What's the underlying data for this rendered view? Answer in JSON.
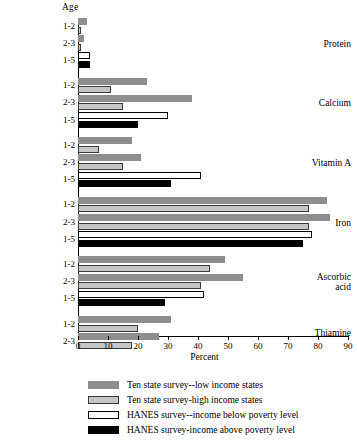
{
  "chart_data": {
    "type": "bar",
    "orientation": "horizontal",
    "title": "",
    "xlabel": "Percent",
    "ylabel": "Age",
    "xlim": [
      0,
      90
    ],
    "xticks": [
      0,
      10,
      20,
      30,
      40,
      50,
      60,
      70,
      80,
      90
    ],
    "grid": false,
    "legend_position": "bottom",
    "series": [
      {
        "name": "Ten state survey--low income states",
        "key": "s0",
        "color": "#8e8e8e"
      },
      {
        "name": "Ten state survey-high income states",
        "key": "s1",
        "color": "#c6c6c6"
      },
      {
        "name": "HANES survey--income below poverty level",
        "key": "s2",
        "color": "#ffffff"
      },
      {
        "name": "HANES survey-income above poverty level",
        "key": "s3",
        "color": "#000000"
      }
    ],
    "groups": [
      {
        "nutrient": "Protein",
        "rows": [
          {
            "age": "1-2",
            "bars": [
              {
                "series": 0,
                "value": 3
              },
              {
                "series": 1,
                "value": 1
              }
            ]
          },
          {
            "age": "2-3",
            "bars": [
              {
                "series": 0,
                "value": 2
              },
              {
                "series": 1,
                "value": 1
              }
            ]
          },
          {
            "age": "1-5",
            "bars": [
              {
                "series": 2,
                "value": 4
              },
              {
                "series": 3,
                "value": 4
              }
            ]
          }
        ]
      },
      {
        "nutrient": "Calcium",
        "rows": [
          {
            "age": "1-2",
            "bars": [
              {
                "series": 0,
                "value": 23
              },
              {
                "series": 1,
                "value": 11
              }
            ]
          },
          {
            "age": "2-3",
            "bars": [
              {
                "series": 0,
                "value": 38
              },
              {
                "series": 1,
                "value": 15
              }
            ]
          },
          {
            "age": "1-5",
            "bars": [
              {
                "series": 2,
                "value": 30
              },
              {
                "series": 3,
                "value": 20
              }
            ]
          }
        ]
      },
      {
        "nutrient": "Vitamin A",
        "rows": [
          {
            "age": "1-2",
            "bars": [
              {
                "series": 0,
                "value": 18
              },
              {
                "series": 1,
                "value": 7
              }
            ]
          },
          {
            "age": "2-3",
            "bars": [
              {
                "series": 0,
                "value": 21
              },
              {
                "series": 1,
                "value": 15
              }
            ]
          },
          {
            "age": "1-5",
            "bars": [
              {
                "series": 2,
                "value": 41
              },
              {
                "series": 3,
                "value": 31
              }
            ]
          }
        ]
      },
      {
        "nutrient": "Iron",
        "rows": [
          {
            "age": "1-2",
            "bars": [
              {
                "series": 0,
                "value": 83
              },
              {
                "series": 1,
                "value": 77
              }
            ]
          },
          {
            "age": "2-3",
            "bars": [
              {
                "series": 0,
                "value": 84
              },
              {
                "series": 1,
                "value": 77
              }
            ]
          },
          {
            "age": "1-5",
            "bars": [
              {
                "series": 2,
                "value": 78
              },
              {
                "series": 3,
                "value": 75
              }
            ]
          }
        ]
      },
      {
        "nutrient": "Ascorbic acid",
        "nutrient_lines": [
          "Ascorbic",
          "acid"
        ],
        "rows": [
          {
            "age": "1-2",
            "bars": [
              {
                "series": 0,
                "value": 49
              },
              {
                "series": 1,
                "value": 44
              }
            ]
          },
          {
            "age": "2-3",
            "bars": [
              {
                "series": 0,
                "value": 55
              },
              {
                "series": 1,
                "value": 41
              }
            ]
          },
          {
            "age": "1-5",
            "bars": [
              {
                "series": 2,
                "value": 42
              },
              {
                "series": 3,
                "value": 29
              }
            ]
          }
        ]
      },
      {
        "nutrient": "Thiamine",
        "rows": [
          {
            "age": "1-2",
            "bars": [
              {
                "series": 0,
                "value": 31
              },
              {
                "series": 1,
                "value": 20
              }
            ]
          },
          {
            "age": "2-3",
            "bars": [
              {
                "series": 0,
                "value": 27
              },
              {
                "series": 1,
                "value": 18
              }
            ]
          }
        ]
      }
    ]
  },
  "axis": {
    "age_header": "Age",
    "x_title": "Percent"
  }
}
